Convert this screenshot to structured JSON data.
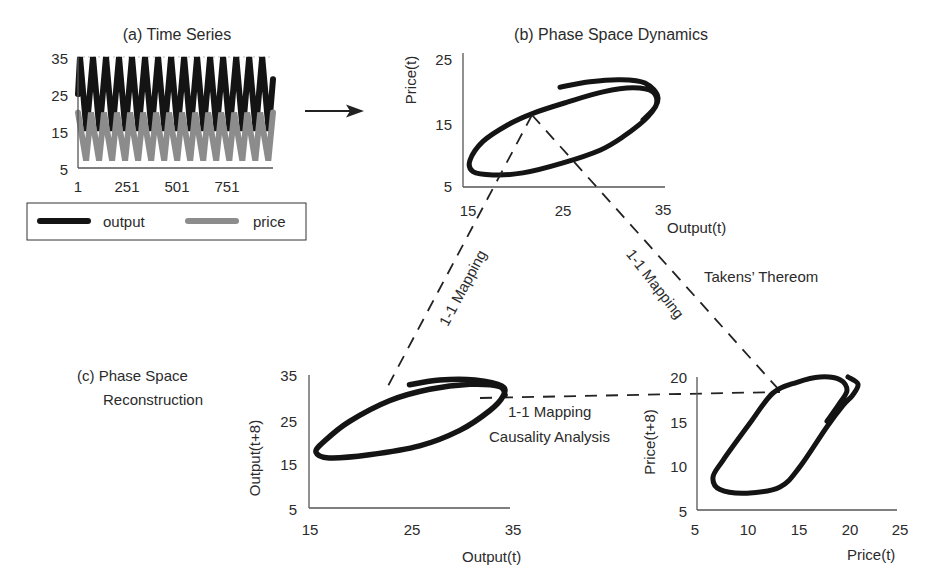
{
  "panels": {
    "a": {
      "title": "(a) Time Series",
      "y_ticks": [
        "35",
        "25",
        "15",
        "5"
      ],
      "x_ticks": [
        "1",
        "251",
        "501",
        "751"
      ],
      "legend": [
        {
          "label": "output",
          "color": "#141414"
        },
        {
          "label": "price",
          "color": "#8c8c8c"
        }
      ]
    },
    "b": {
      "title": "(b) Phase Space Dynamics",
      "xlabel": "Output(t)",
      "ylabel": "Price(t)",
      "y_ticks": [
        "25",
        "15",
        "5"
      ],
      "x_ticks": [
        "15",
        "25",
        "35"
      ]
    },
    "c": {
      "title_line1": "(c) Phase Space",
      "title_line2": "Reconstruction",
      "output_plot": {
        "xlabel": "Output(t)",
        "ylabel": "Output(t+8)",
        "y_ticks": [
          "35",
          "25",
          "15",
          "5"
        ],
        "x_ticks": [
          "15",
          "25",
          "35"
        ]
      },
      "price_plot": {
        "xlabel": "Price(t)",
        "ylabel": "Price(t+8)",
        "y_ticks": [
          "20",
          "15",
          "10",
          "5"
        ],
        "x_ticks": [
          "5",
          "10",
          "15",
          "20",
          "25"
        ]
      }
    }
  },
  "annotations": {
    "mapping_left": "1-1 Mapping",
    "mapping_right": "1-1 Mapping",
    "takens": "Takens’ Thereom",
    "mapping_middle": "1-1 Mapping",
    "causality": "Causality Analysis",
    "arrow_icon": "right-arrow-icon"
  },
  "colors": {
    "output": "#141414",
    "price": "#8c8c8c",
    "trajectory": "#141414",
    "axis": "#555555",
    "dashed": "#222222",
    "text": "#2b2b2b",
    "background": "#ffffff"
  },
  "chart_data": [
    {
      "type": "line",
      "title": "(a) Time Series",
      "xlabel": "",
      "ylabel": "",
      "xlim": [
        1,
        1000
      ],
      "ylim": [
        5,
        35
      ],
      "x_ticks": [
        1,
        251,
        501,
        751
      ],
      "y_ticks": [
        5,
        15,
        25,
        35
      ],
      "grid": false,
      "legend_position": "bottom",
      "series": [
        {
          "name": "output",
          "color": "#141414",
          "points": [
            [
              1,
              25
            ],
            [
              11,
              35
            ],
            [
              44,
              15
            ],
            [
              77,
              35
            ],
            [
              110,
              15
            ],
            [
              143,
              35
            ],
            [
              176,
              15
            ],
            [
              209,
              35
            ],
            [
              242,
              15
            ],
            [
              275,
              35
            ],
            [
              308,
              15
            ],
            [
              341,
              35
            ],
            [
              374,
              15
            ],
            [
              407,
              35
            ],
            [
              440,
              15
            ],
            [
              473,
              35
            ],
            [
              506,
              15
            ],
            [
              539,
              35
            ],
            [
              572,
              15
            ],
            [
              605,
              35
            ],
            [
              638,
              15
            ],
            [
              671,
              35
            ],
            [
              704,
              15
            ],
            [
              737,
              35
            ],
            [
              770,
              15
            ],
            [
              803,
              35
            ],
            [
              836,
              15
            ],
            [
              869,
              35
            ],
            [
              902,
              15
            ],
            [
              935,
              35
            ],
            [
              968,
              15
            ],
            [
              990,
              29
            ]
          ]
        },
        {
          "name": "price",
          "color": "#8c8c8c",
          "points": [
            [
              1,
              20
            ],
            [
              42,
              7
            ],
            [
              67,
              20
            ],
            [
              108,
              7
            ],
            [
              133,
              20
            ],
            [
              174,
              7
            ],
            [
              199,
              20
            ],
            [
              240,
              7
            ],
            [
              265,
              20
            ],
            [
              306,
              7
            ],
            [
              331,
              20
            ],
            [
              372,
              7
            ],
            [
              397,
              20
            ],
            [
              438,
              7
            ],
            [
              463,
              20
            ],
            [
              504,
              7
            ],
            [
              529,
              20
            ],
            [
              570,
              7
            ],
            [
              595,
              20
            ],
            [
              636,
              7
            ],
            [
              661,
              20
            ],
            [
              702,
              7
            ],
            [
              727,
              20
            ],
            [
              768,
              7
            ],
            [
              793,
              20
            ],
            [
              834,
              7
            ],
            [
              859,
              20
            ],
            [
              900,
              7
            ],
            [
              925,
              20
            ],
            [
              966,
              7
            ],
            [
              990,
              20
            ]
          ]
        }
      ]
    },
    {
      "type": "line",
      "title": "(b) Phase Space Dynamics",
      "xlabel": "Output(t)",
      "ylabel": "Price(t)",
      "xlim": [
        15,
        35
      ],
      "ylim": [
        5,
        25
      ],
      "x_ticks": [
        15,
        25,
        35
      ],
      "y_ticks": [
        5,
        15,
        25
      ],
      "grid": false,
      "series": [
        {
          "name": "trajectory",
          "color": "#141414",
          "points": [
            [
              24.7,
              19.9
            ],
            [
              27.7,
              20.7
            ],
            [
              30.7,
              21.0
            ],
            [
              33.2,
              20.5
            ],
            [
              34.5,
              18.3
            ],
            [
              33.5,
              15.5
            ],
            [
              31.0,
              12.5
            ],
            [
              28.7,
              10.5
            ],
            [
              25.0,
              8.6
            ],
            [
              21.0,
              7.1
            ],
            [
              18.0,
              6.8
            ],
            [
              16.0,
              7.3
            ],
            [
              15.7,
              9.0
            ],
            [
              17.0,
              11.8
            ],
            [
              19.5,
              14.3
            ],
            [
              22.0,
              16.0
            ],
            [
              25.5,
              17.7
            ],
            [
              29.0,
              19.2
            ],
            [
              32.0,
              19.8
            ],
            [
              34.0,
              19.2
            ],
            [
              34.3,
              17.2
            ],
            [
              33.0,
              15.0
            ]
          ]
        }
      ]
    },
    {
      "type": "line",
      "title": "(c) Phase Space Reconstruction - Output",
      "xlabel": "Output(t)",
      "ylabel": "Output(t+8)",
      "xlim": [
        15,
        35
      ],
      "ylim": [
        5,
        35
      ],
      "x_ticks": [
        15,
        25,
        35
      ],
      "y_ticks": [
        5,
        15,
        25,
        35
      ],
      "grid": false,
      "series": [
        {
          "name": "trajectory",
          "color": "#141414",
          "points": [
            [
              25.0,
              32.8
            ],
            [
              28.0,
              33.9
            ],
            [
              31.5,
              33.9
            ],
            [
              34.2,
              32.5
            ],
            [
              34.3,
              30.2
            ],
            [
              33.0,
              27.0
            ],
            [
              30.0,
              22.5
            ],
            [
              26.0,
              19.0
            ],
            [
              21.0,
              17.0
            ],
            [
              17.0,
              16.3
            ],
            [
              15.7,
              17.6
            ],
            [
              16.5,
              20.0
            ],
            [
              19.0,
              24.5
            ],
            [
              23.0,
              29.2
            ],
            [
              27.0,
              31.8
            ],
            [
              31.0,
              32.9
            ],
            [
              34.0,
              32.4
            ],
            [
              34.5,
              30.5
            ]
          ]
        }
      ]
    },
    {
      "type": "line",
      "title": "(c) Phase Space Reconstruction - Price",
      "xlabel": "Price(t)",
      "ylabel": "Price(t+8)",
      "xlim": [
        5,
        25
      ],
      "ylim": [
        5,
        20
      ],
      "x_ticks": [
        5,
        10,
        15,
        20,
        25
      ],
      "y_ticks": [
        5,
        10,
        15,
        20
      ],
      "grid": false,
      "series": [
        {
          "name": "trajectory",
          "color": "#141414",
          "points": [
            [
              20.1,
              20.0
            ],
            [
              21.1,
              19.2
            ],
            [
              20.6,
              18.0
            ],
            [
              19.6,
              16.8
            ],
            [
              18.0,
              14.4
            ],
            [
              15.3,
              9.9
            ],
            [
              13.3,
              7.6
            ],
            [
              10.0,
              6.9
            ],
            [
              7.3,
              7.3
            ],
            [
              6.6,
              8.7
            ],
            [
              7.6,
              10.6
            ],
            [
              10.3,
              14.8
            ],
            [
              12.6,
              18.2
            ],
            [
              15.0,
              19.4
            ],
            [
              17.3,
              20.0
            ],
            [
              19.3,
              19.7
            ],
            [
              20.0,
              18.5
            ],
            [
              19.3,
              17.1
            ],
            [
              18.0,
              15.0
            ]
          ]
        }
      ]
    }
  ]
}
